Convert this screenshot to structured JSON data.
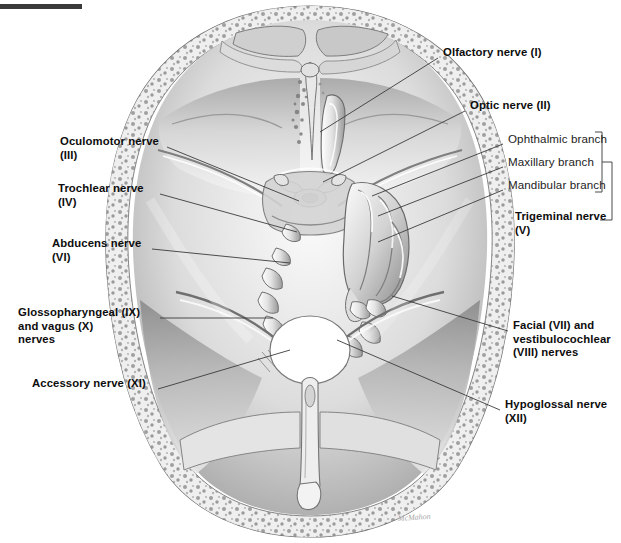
{
  "figure": {
    "title_bar": "",
    "artist_signature": "McMahon"
  },
  "colors": {
    "ink": "#0d0d0d",
    "leader": "#3b3b3b",
    "bone_light": "#f2f2f2",
    "bone_mid": "#c9c9c9",
    "bone_dark": "#8f8f8f",
    "background": "#ffffff",
    "topbar": "#3a3a3a"
  },
  "labels": {
    "right": [
      {
        "id": "olfactory",
        "text": "Olfactory nerve (I)",
        "bold": true,
        "x": 443,
        "y": 52
      },
      {
        "id": "optic",
        "text": "Optic nerve (II)",
        "bold": true,
        "x": 470,
        "y": 105
      },
      {
        "id": "ophthalmic",
        "text": "Ophthalmic branch",
        "bold": false,
        "x": 508,
        "y": 138
      },
      {
        "id": "maxillary",
        "text": "Maxillary branch",
        "bold": false,
        "x": 508,
        "y": 161
      },
      {
        "id": "mandibular",
        "text": "Mandibular branch",
        "bold": false,
        "x": 508,
        "y": 184
      },
      {
        "id": "trigeminal",
        "text": "Trigeminal nerve\n(V)",
        "bold": true,
        "x": 515,
        "y": 216
      },
      {
        "id": "facial-vest",
        "text": "Facial (VII) and\nvestibulocochlear\n(VIII) nerves",
        "bold": true,
        "x": 513,
        "y": 325
      },
      {
        "id": "hypoglossal",
        "text": "Hypoglossal nerve\n(XII)",
        "bold": true,
        "x": 505,
        "y": 404
      }
    ],
    "left": [
      {
        "id": "oculomotor",
        "text": "Oculomotor nerve\n(III)",
        "bold": true,
        "x": 60,
        "y": 141
      },
      {
        "id": "trochlear",
        "text": "Trochlear nerve\n(IV)",
        "bold": true,
        "x": 58,
        "y": 188
      },
      {
        "id": "abducens",
        "text": "Abducens nerve\n(VI)",
        "bold": true,
        "x": 52,
        "y": 243
      },
      {
        "id": "glosso-vagus",
        "text": "Glossopharyngeal (IX)\nand vagus (X)\nnerves",
        "bold": true,
        "x": 18,
        "y": 312
      },
      {
        "id": "accessory",
        "text": "Accessory nerve (XI)",
        "bold": true,
        "x": 32,
        "y": 383
      }
    ]
  },
  "leader_lines": {
    "right": [
      {
        "id": "leader-olfactory",
        "x1": 438,
        "y1": 58,
        "x2": 320,
        "y2": 132
      },
      {
        "id": "leader-optic",
        "x1": 465,
        "y1": 111,
        "x2": 323,
        "y2": 182
      },
      {
        "id": "leader-ophthalmic",
        "x1": 503,
        "y1": 144,
        "x2": 372,
        "y2": 196
      },
      {
        "id": "leader-maxillary",
        "x1": 503,
        "y1": 167,
        "x2": 378,
        "y2": 216
      },
      {
        "id": "leader-mandibular",
        "x1": 503,
        "y1": 190,
        "x2": 378,
        "y2": 242
      },
      {
        "id": "leader-facial",
        "x1": 508,
        "y1": 331,
        "x2": 392,
        "y2": 296
      },
      {
        "id": "leader-hypoglossal",
        "x1": 500,
        "y1": 410,
        "x2": 337,
        "y2": 340
      }
    ],
    "left": [
      {
        "id": "leader-oculomotor",
        "x1": 167,
        "y1": 147,
        "x2": 299,
        "y2": 201
      },
      {
        "id": "leader-trochlear",
        "x1": 160,
        "y1": 194,
        "x2": 297,
        "y2": 232
      },
      {
        "id": "leader-abducens",
        "x1": 152,
        "y1": 249,
        "x2": 290,
        "y2": 263
      },
      {
        "id": "leader-glosso",
        "x1": 160,
        "y1": 318,
        "x2": 273,
        "y2": 318
      },
      {
        "id": "leader-accessory",
        "x1": 158,
        "y1": 389,
        "x2": 290,
        "y2": 350
      }
    ]
  },
  "bracket": {
    "id": "trigeminal-bracket",
    "note": "Vertical bracket grouping the three trigeminal branches, joined to the Trigeminal nerve (V) label",
    "x": 602,
    "top": 132,
    "bottom": 192,
    "stem_y": 220,
    "stem_x2": 612,
    "label_tick_x": 592
  }
}
